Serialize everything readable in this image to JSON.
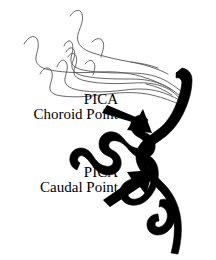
{
  "figure": {
    "type": "medical-illustration",
    "width": 216,
    "height": 260,
    "background_color": "#ffffff"
  },
  "labels": [
    {
      "id": "choroid",
      "line1": "PICA",
      "line2": "Choroid Point",
      "color": "#000000"
    },
    {
      "id": "caudal",
      "line1": "PICA",
      "line2": "Caudal Point",
      "color": "#000000"
    }
  ],
  "arrows": [
    {
      "id": "choroid-arrow",
      "direction": "down-right",
      "color": "#000000"
    },
    {
      "id": "caudal-arrow",
      "direction": "up-right",
      "color": "#000000"
    }
  ],
  "vessels": {
    "main_artery_color": "#000000",
    "choroidal_branch_color": "#555555",
    "main_artery_name": "posterior-inferior-cerebellar-artery",
    "branch_name": "choroidal-vessel-plexus"
  }
}
